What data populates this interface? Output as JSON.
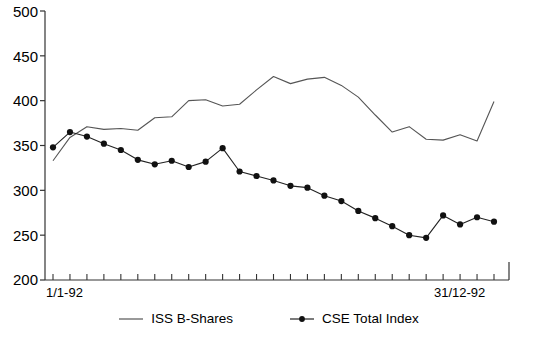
{
  "chart_data": {
    "type": "line",
    "title": "",
    "xlabel": "",
    "ylabel": "",
    "ylim": [
      200,
      500
    ],
    "ytick_labels": [
      "500",
      "450",
      "400",
      "350",
      "300",
      "250",
      "200"
    ],
    "ytick_values": [
      500,
      450,
      400,
      350,
      300,
      250,
      200
    ],
    "xtick_count": 27,
    "x_axis_start_label": "1/1-92",
    "x_axis_end_label": "31/12-92",
    "grid": false,
    "legend_position": "bottom-center",
    "series": [
      {
        "name": "ISS B-Shares",
        "marker": "none",
        "color": "#555555",
        "values": [
          333,
          359,
          371,
          368,
          369,
          367,
          381,
          382,
          400,
          401,
          394,
          396,
          412,
          427,
          419,
          424,
          426,
          417,
          404,
          384,
          365,
          371,
          357,
          356,
          362,
          355,
          399
        ]
      },
      {
        "name": "CSE Total Index",
        "marker": "dot",
        "color": "#222222",
        "values": [
          348,
          365,
          360,
          352,
          345,
          334,
          329,
          333,
          326,
          332,
          347,
          321,
          316,
          311,
          305,
          303,
          294,
          288,
          277,
          269,
          260,
          250,
          247,
          272,
          262,
          270,
          265
        ]
      }
    ]
  },
  "legend": {
    "items": [
      {
        "label": "ISS B-Shares",
        "marker": "line"
      },
      {
        "label": "CSE Total Index",
        "marker": "line-dot"
      }
    ]
  }
}
